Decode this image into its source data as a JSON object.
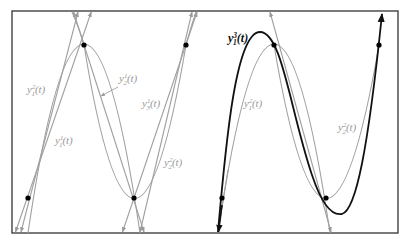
{
  "figure": {
    "colors": {
      "frame": "#333333",
      "grey_curve": "#a0a0a0",
      "black_curve": "#111111",
      "point": "#000000",
      "label_grey": "#9a9a9a",
      "label_black": "#111111"
    },
    "left_panel": {
      "points": [
        [
          28,
          198
        ],
        [
          84,
          45
        ],
        [
          134,
          198
        ],
        [
          186,
          45
        ]
      ],
      "labels": {
        "y1_2": {
          "base": "y",
          "sup": "2",
          "sub": "1",
          "arg": "(t)"
        },
        "y2_1": {
          "base": "y",
          "sup": "1",
          "sub": "2",
          "arg": "(t)"
        },
        "y3_1": {
          "base": "y",
          "sup": "1",
          "sub": "3",
          "arg": "(t)"
        },
        "y1_1": {
          "base": "y",
          "sup": "1",
          "sub": "1",
          "arg": "(t)"
        },
        "y2_2": {
          "base": "y",
          "sup": "2",
          "sub": "2",
          "arg": "(t)"
        }
      }
    },
    "right_panel": {
      "points": [
        [
          222,
          198
        ],
        [
          274,
          45
        ],
        [
          326,
          198
        ],
        [
          379,
          45
        ]
      ],
      "labels": {
        "y1_3": {
          "base": "y",
          "sup": "3",
          "sub": "1",
          "arg": "(t)"
        },
        "y1_2": {
          "base": "y",
          "sup": "2",
          "sub": "1",
          "arg": "(t)"
        },
        "y2_2": {
          "base": "y",
          "sup": "2",
          "sub": "2",
          "arg": "(t)"
        }
      }
    }
  }
}
